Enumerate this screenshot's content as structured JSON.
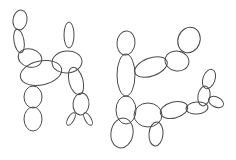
{
  "image": {
    "description": "Line drawing of two balloon-animal-like figures made of overlapping ellipse outlines",
    "background": "#ffffff",
    "stroke_color": "#4a4a4a",
    "figures": [
      {
        "name": "left-figure",
        "ellipses": [
          {
            "cx": 20,
            "cy": 20,
            "rx": 7,
            "ry": 10,
            "rot": 10
          },
          {
            "cx": 19,
            "cy": 41,
            "rx": 5,
            "ry": 12,
            "rot": -10
          },
          {
            "cx": 30,
            "cy": 58,
            "rx": 12,
            "ry": 9,
            "rot": 15
          },
          {
            "cx": 41,
            "cy": 73,
            "rx": 21,
            "ry": 12,
            "rot": -12
          },
          {
            "cx": 67,
            "cy": 62,
            "rx": 15,
            "ry": 11,
            "rot": -5
          },
          {
            "cx": 69,
            "cy": 35,
            "rx": 5,
            "ry": 13,
            "rot": 0
          },
          {
            "cx": 76,
            "cy": 81,
            "rx": 7,
            "ry": 14,
            "rot": -15
          },
          {
            "cx": 81,
            "cy": 104,
            "rx": 8,
            "ry": 11,
            "rot": 5
          },
          {
            "cx": 71,
            "cy": 119,
            "rx": 3,
            "ry": 7,
            "rot": 30
          },
          {
            "cx": 88,
            "cy": 119,
            "rx": 3,
            "ry": 7,
            "rot": -30
          },
          {
            "cx": 33,
            "cy": 97,
            "rx": 9,
            "ry": 11,
            "rot": 0
          },
          {
            "cx": 33,
            "cy": 119,
            "rx": 9,
            "ry": 12,
            "rot": 0
          }
        ]
      },
      {
        "name": "right-figure",
        "ellipses": [
          {
            "cx": 126,
            "cy": 43,
            "rx": 9,
            "ry": 12,
            "rot": 5
          },
          {
            "cx": 126,
            "cy": 75,
            "rx": 9,
            "ry": 21,
            "rot": 0
          },
          {
            "cx": 151,
            "cy": 67,
            "rx": 17,
            "ry": 9,
            "rot": -20
          },
          {
            "cx": 177,
            "cy": 61,
            "rx": 12,
            "ry": 10,
            "rot": 10
          },
          {
            "cx": 189,
            "cy": 40,
            "rx": 11,
            "ry": 13,
            "rot": 20
          },
          {
            "cx": 126,
            "cy": 110,
            "rx": 10,
            "ry": 14,
            "rot": 0
          },
          {
            "cx": 122,
            "cy": 133,
            "rx": 11,
            "ry": 15,
            "rot": 10
          },
          {
            "cx": 148,
            "cy": 115,
            "rx": 14,
            "ry": 12,
            "rot": 0
          },
          {
            "cx": 156,
            "cy": 134,
            "rx": 7,
            "ry": 12,
            "rot": 5
          },
          {
            "cx": 174,
            "cy": 110,
            "rx": 14,
            "ry": 8,
            "rot": -15
          },
          {
            "cx": 197,
            "cy": 108,
            "rx": 11,
            "ry": 6,
            "rot": -5
          },
          {
            "cx": 209,
            "cy": 79,
            "rx": 6,
            "ry": 10,
            "rot": 20
          },
          {
            "cx": 204,
            "cy": 96,
            "rx": 6,
            "ry": 10,
            "rot": 10
          },
          {
            "cx": 216,
            "cy": 102,
            "rx": 8,
            "ry": 5,
            "rot": 25
          }
        ]
      }
    ]
  }
}
